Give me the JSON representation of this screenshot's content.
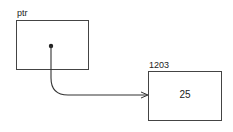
{
  "diagram": {
    "pointer": {
      "label": "ptr"
    },
    "target": {
      "address": "1203",
      "value": "25"
    },
    "colors": {
      "stroke": "#333333",
      "background": "#ffffff"
    }
  }
}
